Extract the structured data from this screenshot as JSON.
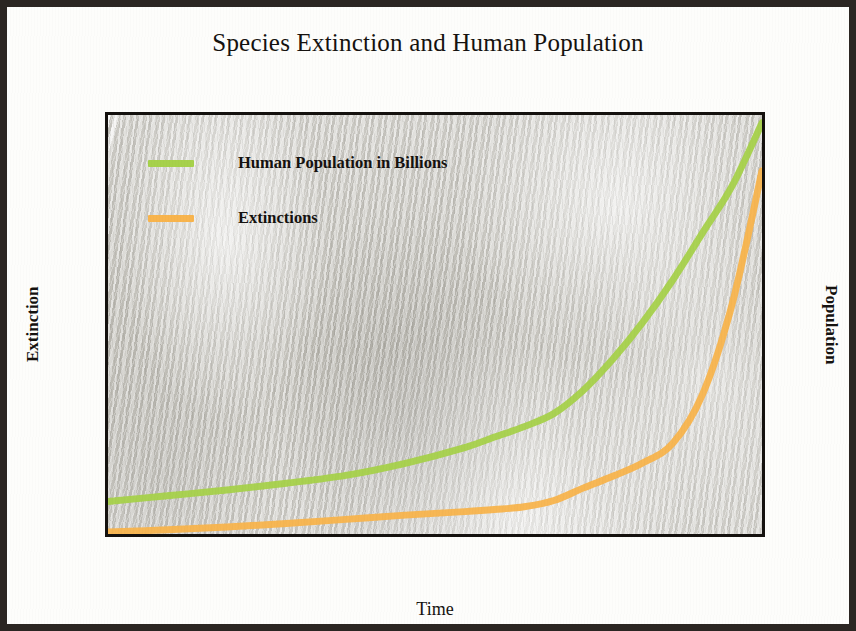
{
  "figure": {
    "title": "Species Extinction and Human Population",
    "background_color": "#cfcdc6",
    "page_color": "#fdfdfb",
    "border_color": "#2b2622"
  },
  "chart_data": {
    "type": "line",
    "title": "Species Extinction and Human Population",
    "xlabel": "Time",
    "ylabel": "Extinction",
    "y2label": "Population",
    "xlim": [
      1800,
      2020
    ],
    "ylim": [
      0,
      60000
    ],
    "y2lim": [
      0,
      8
    ],
    "grid": false,
    "legend_position": "upper left",
    "xticks": [
      "1800",
      "1830",
      "1860",
      "1890",
      "1920",
      "1950",
      "1980",
      "2010"
    ],
    "xtick_values": [
      1800,
      1830,
      1860,
      1890,
      1920,
      1950,
      1980,
      2010
    ],
    "xtick_minor_step": 10,
    "yticks": [
      "0",
      "10,000",
      "20,000",
      "30,000",
      "40,000",
      "50,000",
      "60,000"
    ],
    "ytick_values": [
      0,
      10000,
      20000,
      30000,
      40000,
      50000,
      60000
    ],
    "y2ticks": [
      "0",
      "1",
      "2",
      "3",
      "4",
      "5",
      "6",
      "7",
      "8"
    ],
    "y2tick_values": [
      0,
      1,
      2,
      3,
      4,
      5,
      6,
      7,
      8
    ],
    "series": [
      {
        "name": "Human Population in Billions",
        "axis": "right",
        "color": "#a6d14b",
        "x": [
          1800,
          1820,
          1840,
          1860,
          1880,
          1900,
          1920,
          1930,
          1940,
          1950,
          1960,
          1970,
          1980,
          1990,
          2000,
          2010,
          2020
        ],
        "values": [
          0.62,
          0.73,
          0.84,
          0.97,
          1.12,
          1.35,
          1.65,
          1.85,
          2.05,
          2.3,
          2.75,
          3.35,
          4.05,
          4.85,
          5.75,
          6.65,
          7.85
        ]
      },
      {
        "name": "Extinctions",
        "axis": "left",
        "color": "#f8b44d",
        "x": [
          1800,
          1820,
          1840,
          1860,
          1880,
          1900,
          1920,
          1930,
          1940,
          1950,
          1960,
          1970,
          1980,
          1990,
          2000,
          2010,
          2020
        ],
        "values": [
          300,
          600,
          1000,
          1500,
          2100,
          2700,
          3200,
          3500,
          3900,
          4800,
          6600,
          8300,
          10200,
          13000,
          20000,
          33000,
          52000
        ]
      }
    ]
  },
  "legend": {
    "items": [
      {
        "label": "Human Population in Billions",
        "color": "#a6d14b"
      },
      {
        "label": "Extinctions",
        "color": "#f8b44d"
      }
    ]
  }
}
